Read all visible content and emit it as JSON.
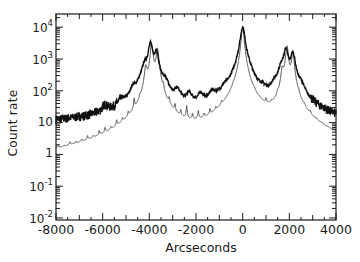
{
  "chart_data": {
    "type": "line",
    "title": "",
    "xlabel": "Arcseconds",
    "ylabel": "Count rate",
    "xlim": [
      -8000,
      4000
    ],
    "ylim": [
      0.01,
      20000
    ],
    "yscale": "log",
    "grid": false,
    "legend": null,
    "x_ticks": [
      -8000,
      -6000,
      -4000,
      -2000,
      0,
      2000,
      4000
    ],
    "x_tick_labels": [
      "-8000",
      "-6000",
      "-4000",
      "-2000",
      "0",
      "2000",
      "4000"
    ],
    "y_ticks": [
      10000,
      1000,
      100,
      10,
      1,
      0.1,
      0.01
    ],
    "y_tick_labels": [
      {
        "base": "10",
        "exp": "4"
      },
      {
        "base": "10",
        "exp": "3"
      },
      {
        "base": "10",
        "exp": "2"
      },
      {
        "base": "10",
        "exp": ""
      },
      {
        "base": "1",
        "exp": ""
      },
      {
        "base": "10",
        "exp": "-1"
      },
      {
        "base": "10",
        "exp": "-2"
      }
    ],
    "series": [
      {
        "name": "Measured (noisy, thick)",
        "style": "thick-noisy",
        "background_level": 8,
        "peaks": [
          {
            "x": -5900,
            "y": 14
          },
          {
            "x": -5200,
            "y": 18
          },
          {
            "x": -4700,
            "y": 60
          },
          {
            "x": -4450,
            "y": 30
          },
          {
            "x": -4200,
            "y": 500
          },
          {
            "x": -3950,
            "y": 3000
          },
          {
            "x": -3700,
            "y": 1500
          },
          {
            "x": -3300,
            "y": 120
          },
          {
            "x": -2800,
            "y": 70
          },
          {
            "x": -2300,
            "y": 45
          },
          {
            "x": -1800,
            "y": 40
          },
          {
            "x": -1300,
            "y": 40
          },
          {
            "x": -800,
            "y": 35
          },
          {
            "x": -300,
            "y": 25
          },
          {
            "x": 0,
            "y": 10000
          },
          {
            "x": 350,
            "y": 50
          },
          {
            "x": 850,
            "y": 30
          },
          {
            "x": 1350,
            "y": 60
          },
          {
            "x": 1650,
            "y": 400
          },
          {
            "x": 1850,
            "y": 2000
          },
          {
            "x": 2150,
            "y": 1500
          },
          {
            "x": 2500,
            "y": 80
          }
        ]
      },
      {
        "name": "Model (thin, periodic)",
        "style": "thin",
        "period": 250,
        "floor": 0.012,
        "peaks": [
          {
            "x": -7900,
            "y": 0.3
          },
          {
            "x": -7650,
            "y": 0.12
          },
          {
            "x": -7400,
            "y": 0.5
          },
          {
            "x": -7150,
            "y": 0.3
          },
          {
            "x": -6900,
            "y": 0.4
          },
          {
            "x": -6650,
            "y": 0.9
          },
          {
            "x": -6400,
            "y": 0.5
          },
          {
            "x": -6150,
            "y": 1.5
          },
          {
            "x": -5900,
            "y": 2
          },
          {
            "x": -5650,
            "y": 1.2
          },
          {
            "x": -5400,
            "y": 4
          },
          {
            "x": -5150,
            "y": 3
          },
          {
            "x": -4900,
            "y": 6
          },
          {
            "x": -4650,
            "y": 30
          },
          {
            "x": -4400,
            "y": 15
          },
          {
            "x": -4150,
            "y": 500
          },
          {
            "x": -3900,
            "y": 3000
          },
          {
            "x": -3650,
            "y": 2000
          },
          {
            "x": -3400,
            "y": 60
          },
          {
            "x": -3150,
            "y": 20
          },
          {
            "x": -2900,
            "y": 15
          },
          {
            "x": -2650,
            "y": 8
          },
          {
            "x": -2400,
            "y": 20
          },
          {
            "x": -2150,
            "y": 6
          },
          {
            "x": -1900,
            "y": 10
          },
          {
            "x": -1650,
            "y": 4
          },
          {
            "x": -1400,
            "y": 8
          },
          {
            "x": -1150,
            "y": 6
          },
          {
            "x": -900,
            "y": 9
          },
          {
            "x": -650,
            "y": 3
          },
          {
            "x": -400,
            "y": 12
          },
          {
            "x": -150,
            "y": 5
          },
          {
            "x": 0,
            "y": 10000
          },
          {
            "x": 250,
            "y": 4
          },
          {
            "x": 500,
            "y": 12
          },
          {
            "x": 750,
            "y": 3
          },
          {
            "x": 1000,
            "y": 15
          },
          {
            "x": 1250,
            "y": 6
          },
          {
            "x": 1500,
            "y": 20
          },
          {
            "x": 1700,
            "y": 400
          },
          {
            "x": 1900,
            "y": 2500
          },
          {
            "x": 2150,
            "y": 1500
          },
          {
            "x": 2400,
            "y": 15
          },
          {
            "x": 2650,
            "y": 6
          },
          {
            "x": 2900,
            "y": 4
          },
          {
            "x": 3150,
            "y": 1.5
          },
          {
            "x": 3400,
            "y": 0.8
          },
          {
            "x": 3650,
            "y": 0.5
          },
          {
            "x": 3900,
            "y": 1
          }
        ]
      }
    ]
  }
}
